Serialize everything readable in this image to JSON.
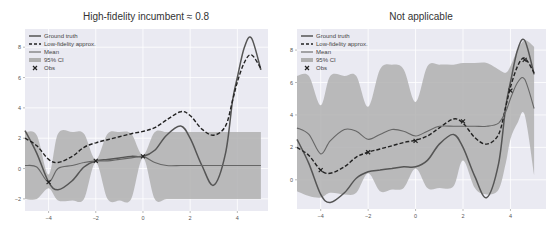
{
  "chart_data": [
    {
      "type": "line",
      "title": "High-fidelity incumbent ≈ 0.8",
      "xlabel": "",
      "ylabel": "",
      "xlim": [
        -5,
        5.3
      ],
      "ylim": [
        -2.8,
        9.2
      ],
      "xticks": [
        -4,
        -2,
        0,
        2,
        4
      ],
      "yticks": [
        -2,
        0,
        2,
        4,
        6,
        8
      ],
      "grid": true,
      "legend": {
        "position": "upper left",
        "entries": [
          "Ground truth",
          "Low-fidelity approx.",
          "Mean",
          "95% CI",
          "Obs"
        ]
      },
      "x": [
        -5,
        -4.5,
        -4,
        -3.6,
        -3,
        -2.5,
        -2,
        -1.5,
        -1,
        -0.5,
        0,
        0.5,
        1,
        1.6,
        2,
        2.5,
        3,
        3.5,
        3.8,
        4,
        4.3,
        4.6,
        5
      ],
      "series": [
        {
          "name": "Ground truth",
          "style": "solid",
          "values": [
            2.5,
            1.0,
            -0.9,
            -1.4,
            -0.8,
            0.1,
            0.5,
            0.6,
            0.7,
            0.8,
            0.8,
            1.2,
            2.2,
            2.8,
            2.0,
            0.2,
            -1.1,
            1.0,
            4.5,
            6.0,
            8.0,
            8.6,
            6.5
          ]
        },
        {
          "name": "Low-fidelity approx.",
          "style": "dashed",
          "values": [
            2.0,
            1.5,
            0.6,
            0.4,
            0.8,
            1.4,
            1.7,
            1.9,
            2.1,
            2.3,
            2.45,
            2.7,
            3.2,
            3.75,
            3.5,
            2.6,
            2.2,
            2.8,
            4.5,
            5.7,
            7.0,
            7.5,
            6.6
          ]
        },
        {
          "name": "Mean",
          "style": "solid-thin",
          "values": [
            0.2,
            0.1,
            -0.9,
            0.0,
            0.2,
            0.4,
            0.5,
            0.5,
            0.6,
            0.7,
            0.8,
            0.4,
            0.2,
            0.2,
            0.2,
            0.2,
            0.2,
            0.2,
            0.2,
            0.2,
            0.2,
            0.2,
            0.2
          ]
        },
        {
          "name": "95% CI upper",
          "values": [
            2.4,
            2.2,
            -0.4,
            2.3,
            2.4,
            2.3,
            0.6,
            2.3,
            2.4,
            2.3,
            0.9,
            2.4,
            2.4,
            2.4,
            2.4,
            2.4,
            2.4,
            2.4,
            2.4,
            2.4,
            2.4,
            2.4,
            2.4
          ]
        },
        {
          "name": "95% CI lower",
          "values": [
            -2.0,
            -2.0,
            -1.3,
            -2.1,
            -2.1,
            -2.0,
            0.4,
            -2.0,
            -2.1,
            -2.0,
            0.7,
            -2.0,
            -2.0,
            -2.0,
            -2.0,
            -2.0,
            -2.0,
            -2.0,
            -2.0,
            -2.0,
            -2.0,
            -2.0,
            -2.0
          ]
        }
      ],
      "observations": [
        {
          "x": -4,
          "y": -0.9
        },
        {
          "x": -2,
          "y": 0.5
        },
        {
          "x": 0,
          "y": 0.8
        }
      ]
    },
    {
      "type": "line",
      "title": "Not applicable",
      "xlabel": "",
      "ylabel": "",
      "xlim": [
        -5,
        5.5
      ],
      "ylim": [
        -1.8,
        9.3
      ],
      "xticks": [
        -4,
        -2,
        0,
        2,
        4
      ],
      "yticks": [
        0,
        2,
        4,
        6,
        8
      ],
      "grid": true,
      "legend": {
        "position": "upper left",
        "entries": [
          "Ground truth",
          "Low-fidelity approx.",
          "Mean",
          "95% CI",
          "Obs"
        ]
      },
      "x": [
        -5,
        -4.5,
        -4,
        -3.6,
        -3,
        -2.5,
        -2,
        -1.5,
        -1,
        -0.5,
        0,
        0.5,
        1,
        1.6,
        2,
        2.5,
        3,
        3.5,
        3.8,
        4,
        4.3,
        4.6,
        5
      ],
      "series": [
        {
          "name": "Ground truth",
          "style": "solid",
          "values": [
            2.5,
            1.0,
            -0.9,
            -1.4,
            -0.8,
            0.1,
            0.5,
            0.6,
            0.7,
            0.8,
            0.8,
            1.2,
            2.2,
            2.8,
            2.0,
            0.2,
            -1.1,
            1.0,
            4.5,
            6.0,
            8.0,
            8.6,
            6.5
          ]
        },
        {
          "name": "Low-fidelity approx.",
          "style": "dashed",
          "values": [
            2.0,
            1.5,
            0.6,
            0.4,
            0.8,
            1.4,
            1.7,
            1.9,
            2.1,
            2.3,
            2.45,
            2.7,
            3.2,
            3.75,
            3.5,
            2.6,
            2.2,
            2.8,
            4.5,
            5.7,
            7.0,
            7.5,
            6.6
          ]
        },
        {
          "name": "Mean",
          "style": "solid-thin",
          "values": [
            3.2,
            2.8,
            1.6,
            2.4,
            3.1,
            3.0,
            2.5,
            2.8,
            3.1,
            3.0,
            2.7,
            3.0,
            3.3,
            3.3,
            3.3,
            3.3,
            3.3,
            3.5,
            4.2,
            5.0,
            6.0,
            6.2,
            4.4
          ]
        },
        {
          "name": "95% CI upper",
          "values": [
            6.4,
            6.4,
            4.6,
            6.4,
            6.4,
            6.4,
            4.5,
            6.8,
            7.1,
            6.8,
            4.8,
            7.0,
            7.1,
            7.1,
            7.2,
            7.2,
            7.2,
            6.8,
            6.6,
            7.0,
            8.0,
            8.6,
            8.2
          ]
        },
        {
          "name": "95% CI lower",
          "values": [
            -0.7,
            -1.0,
            -1.1,
            -0.8,
            -0.9,
            -0.8,
            0.4,
            -0.7,
            -0.6,
            -0.5,
            0.7,
            -0.5,
            -0.5,
            -0.4,
            1.2,
            -0.5,
            -0.9,
            -0.6,
            1.0,
            2.5,
            3.5,
            4.0,
            0.3
          ]
        }
      ],
      "observations": [
        {
          "x": -4,
          "y": 0.6
        },
        {
          "x": -2,
          "y": 1.7
        },
        {
          "x": 0,
          "y": 2.4
        },
        {
          "x": 2,
          "y": 3.6
        },
        {
          "x": 4,
          "y": 5.5
        },
        {
          "x": 4.6,
          "y": 7.4
        }
      ]
    }
  ],
  "colors": {
    "plot_bg": "#eaeaf2",
    "grid": "#ffffff",
    "ci_fill": "#b0b0b0",
    "line": "#555555",
    "dashed": "#222222"
  }
}
